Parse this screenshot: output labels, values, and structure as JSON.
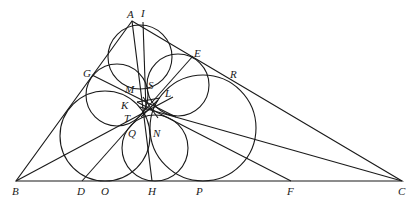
{
  "figure": {
    "stroke_color": "#1a1a1a",
    "background": "#ffffff",
    "points": {
      "A": {
        "label": "A",
        "x": 132,
        "y": 21
      },
      "B": {
        "label": "B",
        "x": 16,
        "y": 181
      },
      "C": {
        "label": "C",
        "x": 402,
        "y": 181
      },
      "I": {
        "label": "I",
        "x": 143,
        "y": 22
      },
      "E": {
        "label": "E",
        "x": 193,
        "y": 56
      },
      "R": {
        "label": "R",
        "x": 232,
        "y": 75
      },
      "G": {
        "label": "G",
        "x": 92,
        "y": 75
      },
      "M": {
        "label": "M",
        "x": 131,
        "y": 89
      },
      "S": {
        "label": "S",
        "x": 152,
        "y": 85
      },
      "L": {
        "label": "L",
        "x": 168,
        "y": 94
      },
      "K": {
        "label": "K",
        "x": 125,
        "y": 103
      },
      "T": {
        "label": "T",
        "x": 127,
        "y": 118
      },
      "Q": {
        "label": "Q",
        "x": 132,
        "y": 135
      },
      "N": {
        "label": "N",
        "x": 157,
        "y": 135
      },
      "D": {
        "label": "D",
        "x": 82,
        "y": 181
      },
      "O": {
        "label": "O",
        "x": 105,
        "y": 181
      },
      "H": {
        "label": "H",
        "x": 152,
        "y": 181
      },
      "P": {
        "label": "P",
        "x": 200,
        "y": 181
      },
      "F": {
        "label": "F",
        "x": 291,
        "y": 181
      }
    },
    "labels": [
      {
        "name": "A",
        "text": "A",
        "x": 127,
        "y": 18
      },
      {
        "name": "I",
        "text": "I",
        "x": 141,
        "y": 17
      },
      {
        "name": "E",
        "text": "E",
        "x": 194,
        "y": 57
      },
      {
        "name": "R",
        "text": "R",
        "x": 230,
        "y": 78
      },
      {
        "name": "G",
        "text": "G",
        "x": 83,
        "y": 77
      },
      {
        "name": "M",
        "text": "M",
        "x": 125,
        "y": 93
      },
      {
        "name": "S",
        "text": "S",
        "x": 148,
        "y": 89
      },
      {
        "name": "L",
        "text": "L",
        "x": 165,
        "y": 97
      },
      {
        "name": "K",
        "text": "K",
        "x": 121,
        "y": 109
      },
      {
        "name": "T",
        "text": "T",
        "x": 124,
        "y": 122
      },
      {
        "name": "Q",
        "text": "Q",
        "x": 128,
        "y": 137
      },
      {
        "name": "N",
        "text": "N",
        "x": 153,
        "y": 137
      },
      {
        "name": "B",
        "text": "B",
        "x": 12,
        "y": 195
      },
      {
        "name": "D",
        "text": "D",
        "x": 77,
        "y": 195
      },
      {
        "name": "O",
        "text": "O",
        "x": 101,
        "y": 195
      },
      {
        "name": "H",
        "text": "H",
        "x": 148,
        "y": 195
      },
      {
        "name": "P",
        "text": "P",
        "x": 196,
        "y": 195
      },
      {
        "name": "F",
        "text": "F",
        "x": 287,
        "y": 195
      },
      {
        "name": "C",
        "text": "C",
        "x": 398,
        "y": 195
      }
    ],
    "triangle": {
      "vertices": [
        "A",
        "B",
        "C"
      ]
    },
    "circles": [
      {
        "name": "top",
        "cx": 140,
        "cy": 57,
        "r": 32
      },
      {
        "name": "upper-left",
        "cx": 117,
        "cy": 95,
        "r": 31
      },
      {
        "name": "upper-right",
        "cx": 178,
        "cy": 85,
        "r": 31
      },
      {
        "name": "lower-left-large",
        "cx": 105,
        "cy": 136,
        "r": 45
      },
      {
        "name": "lower-middle-small",
        "cx": 155,
        "cy": 148,
        "r": 33
      },
      {
        "name": "lower-right-large",
        "cx": 203,
        "cy": 128,
        "r": 53
      }
    ],
    "segments": [
      {
        "name": "A-H",
        "x1": 132,
        "y1": 21,
        "x2": 152,
        "y2": 181
      },
      {
        "name": "I-to-center",
        "x1": 143,
        "y1": 22,
        "x2": 146,
        "y2": 110
      },
      {
        "name": "G-to-center",
        "x1": 92,
        "y1": 75,
        "x2": 176,
        "y2": 117
      },
      {
        "name": "E-D",
        "x1": 193,
        "y1": 56,
        "x2": 82,
        "y2": 181
      },
      {
        "name": "B-to-center",
        "x1": 16,
        "y1": 181,
        "x2": 173,
        "y2": 97
      },
      {
        "name": "C-to-center",
        "x1": 402,
        "y1": 181,
        "x2": 140,
        "y2": 107
      },
      {
        "name": "F-to-center",
        "x1": 291,
        "y1": 181,
        "x2": 137,
        "y2": 102
      },
      {
        "name": "star-1",
        "x1": 137,
        "y1": 102,
        "x2": 160,
        "y2": 98
      },
      {
        "name": "star-2",
        "x1": 143,
        "y1": 97,
        "x2": 158,
        "y2": 118
      },
      {
        "name": "star-3",
        "x1": 158,
        "y1": 100,
        "x2": 141,
        "y2": 117
      }
    ]
  }
}
